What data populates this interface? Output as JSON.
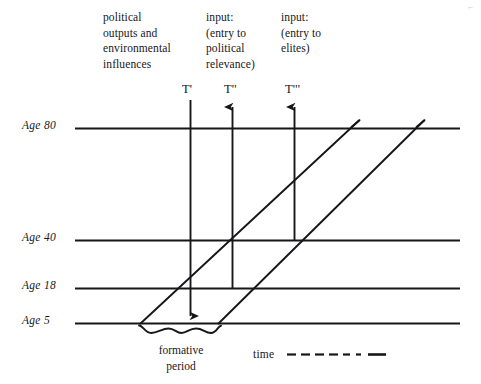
{
  "figure": {
    "kind": "timeline-diagram",
    "ink_color": "#17171a",
    "background_color": "#ffffff"
  },
  "column_headings": [
    {
      "id": "col-outputs",
      "text": "political\noutputs and\nenvironmental\ninfluences"
    },
    {
      "id": "col-political-relevance",
      "text": "input:\n(entry to\npolitical\nrelevance)"
    },
    {
      "id": "col-elites",
      "text": "input:\n(entry to\nelites)"
    }
  ],
  "time_markers": [
    {
      "id": "t-prime",
      "label": "T'",
      "direction": "down"
    },
    {
      "id": "t-double-prime",
      "label": "T''",
      "direction": "up"
    },
    {
      "id": "t-triple-prime",
      "label": "T'''",
      "direction": "up"
    }
  ],
  "age_axis": {
    "lines": [
      {
        "id": "age-80",
        "label": "Age 80"
      },
      {
        "id": "age-40",
        "label": "Age 40"
      },
      {
        "id": "age-18",
        "label": "Age 18"
      },
      {
        "id": "age-5",
        "label": "Age 5"
      }
    ]
  },
  "annotations": {
    "formative_period": "formative\nperiod"
  },
  "legend": {
    "time_label": "time"
  }
}
